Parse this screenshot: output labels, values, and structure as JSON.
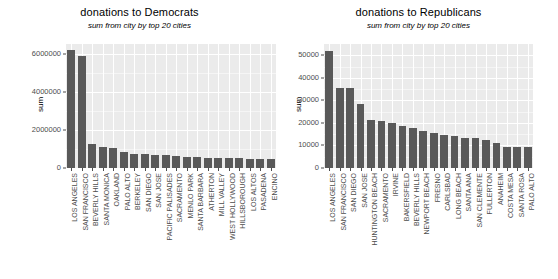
{
  "chart_data": [
    {
      "type": "bar",
      "title": "donations to Democrats",
      "subtitle": "sum from city by top 20 cities",
      "xlabel": "",
      "ylabel": "sum",
      "ylim": [
        0,
        6500000
      ],
      "yticks": [
        0,
        2000000,
        4000000,
        6000000
      ],
      "ytick_labels": [
        "0",
        "2000000",
        "4000000",
        "6000000"
      ],
      "grid": true,
      "legend": "none",
      "bar_color": "#595959",
      "panel_color": "#ebebeb",
      "categories": [
        "LOS ANGELES",
        "SAN FRANCISCO",
        "BEVERLY HILLS",
        "SANTA MONICA",
        "OAKLAND",
        "PALO ALTO",
        "BERKELEY",
        "SAN DIEGO",
        "SAN JOSE",
        "PACIFIC PALISADES",
        "SACRAMENTO",
        "MENLO PARK",
        "SANTA BARBARA",
        "ATHERTON",
        "MILL VALLEY",
        "WEST HOLLYWOOD",
        "HILLSBOROUGH",
        "LOS ALTOS",
        "PASADENA",
        "ENCINO"
      ],
      "values": [
        6200000,
        5850000,
        1250000,
        1080000,
        1030000,
        830000,
        760000,
        720000,
        700000,
        660000,
        620000,
        600000,
        570000,
        550000,
        530000,
        510000,
        500000,
        480000,
        460000,
        450000
      ]
    },
    {
      "type": "bar",
      "title": "donations to Republicans",
      "subtitle": "sum from city by top 20 cities",
      "xlabel": "",
      "ylabel": "sum",
      "ylim": [
        0,
        55000
      ],
      "yticks": [
        0,
        10000,
        20000,
        30000,
        40000,
        50000
      ],
      "ytick_labels": [
        "0",
        "10000",
        "20000",
        "30000",
        "40000",
        "50000"
      ],
      "grid": true,
      "legend": "none",
      "bar_color": "#595959",
      "panel_color": "#ebebeb",
      "categories": [
        "LOS ANGELES",
        "SAN FRANCISCO",
        "SAN DIEGO",
        "SAN JOSE",
        "HUNTINGTON BEACH",
        "SACRAMENTO",
        "IRVINE",
        "BAKERSFIELD",
        "BEVERLY HILLS",
        "NEWPORT BEACH",
        "FRESNO",
        "CARLSBAD",
        "LONG BEACH",
        "SANTA ANA",
        "SAN CLEMENTE",
        "FULLERTON",
        "ANAHEIM",
        "COSTA MESA",
        "SANTA ROSA",
        "PALO ALTO"
      ],
      "values": [
        52000,
        35500,
        35300,
        28500,
        21500,
        20700,
        19800,
        18600,
        17700,
        16600,
        15500,
        14700,
        14200,
        13400,
        13100,
        12600,
        11300,
        9400,
        9300,
        9200
      ]
    }
  ]
}
